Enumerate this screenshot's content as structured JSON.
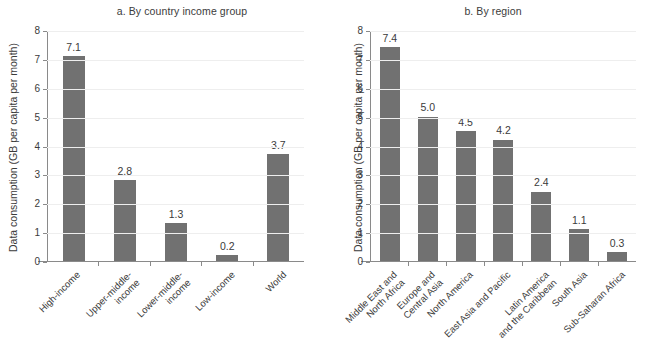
{
  "figure": {
    "background_color": "#ffffff",
    "bar_color": "#717171",
    "axis_color": "#8a8a8a",
    "text_color": "#3b3b3b",
    "ylabel": "Data consumption (GB per capita per month)",
    "ytick_labels": [
      "0",
      "1",
      "2",
      "3",
      "4",
      "5",
      "6",
      "7",
      "8"
    ]
  },
  "chart_data": [
    {
      "type": "bar",
      "title": "a. By country income group",
      "panel": "a",
      "xlabel": "",
      "ylabel": "Data consumption (GB per capita per month)",
      "ylim": [
        0,
        8
      ],
      "yticks": [
        0,
        1,
        2,
        3,
        4,
        5,
        6,
        7,
        8
      ],
      "grid": true,
      "legend": "none",
      "categories": [
        "High-income",
        "Upper-middle-\nincome",
        "Lower-middle-\nincome",
        "Low-income",
        "World"
      ],
      "values": [
        7.1,
        2.8,
        1.3,
        0.2,
        3.7
      ],
      "value_labels": [
        "7.1",
        "2.8",
        "1.3",
        "0.2",
        "3.7"
      ]
    },
    {
      "type": "bar",
      "title": "b. By region",
      "panel": "b",
      "xlabel": "",
      "ylabel": "Data consumption (GB per capita per month)",
      "ylim": [
        0,
        8
      ],
      "yticks": [
        0,
        1,
        2,
        3,
        4,
        5,
        6,
        7,
        8
      ],
      "grid": true,
      "legend": "none",
      "categories": [
        "Middle East and\nNorth Africa",
        "Europe and\nCentral Asia",
        "North America",
        "East Asia and Pacific",
        "Latin America\nand the Caribbean",
        "South Asia",
        "Sub-Saharan Africa"
      ],
      "values": [
        7.4,
        5.0,
        4.5,
        4.2,
        2.4,
        1.1,
        0.3
      ],
      "value_labels": [
        "7.4",
        "5.0",
        "4.5",
        "4.2",
        "2.4",
        "1.1",
        "0.3"
      ]
    }
  ]
}
